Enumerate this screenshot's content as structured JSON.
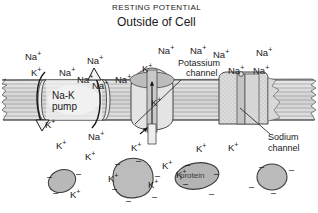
{
  "figure": {
    "title_top": "RESTING POTENTIAL",
    "title_sub": "Outside of Cell",
    "colors": {
      "ink": "#1a1a1a",
      "membrane": "#d9d9d9",
      "protein_fill": "#b5b5b5",
      "paper": "#ffffff"
    }
  },
  "labels": {
    "potassium_channel_line1": "Potassium",
    "potassium_channel_line2": "channel",
    "sodium_channel_line1": "Sodium",
    "sodium_channel_line2": "channel",
    "pump_line1": "Na-K",
    "pump_line2": "pump",
    "protein": "protein"
  },
  "ions": {
    "sodium": "Na",
    "potassium": "K",
    "charge_plus": "+",
    "charge_minus": "–"
  },
  "outside_ions": [
    {
      "label": "Na",
      "x": 25,
      "y": 50
    },
    {
      "label": "K",
      "x": 31,
      "y": 66
    },
    {
      "label": "Na",
      "x": 59,
      "y": 66
    },
    {
      "label": "Na",
      "x": 87,
      "y": 54
    },
    {
      "label": "Na",
      "x": 92,
      "y": 79
    },
    {
      "label": "Na",
      "x": 115,
      "y": 73
    },
    {
      "label": "Na",
      "x": 158,
      "y": 44
    },
    {
      "label": "K",
      "x": 142,
      "y": 62
    },
    {
      "label": "Na",
      "x": 190,
      "y": 44
    },
    {
      "label": "Na",
      "x": 213,
      "y": 48
    },
    {
      "label": "Na",
      "x": 256,
      "y": 46
    },
    {
      "label": "Na",
      "x": 228,
      "y": 64
    },
    {
      "label": "Na",
      "x": 253,
      "y": 64
    }
  ],
  "inside_ions": [
    {
      "label": "K",
      "x": 56,
      "y": 139
    },
    {
      "label": "Na",
      "x": 88,
      "y": 130
    },
    {
      "label": "K",
      "x": 85,
      "y": 150
    },
    {
      "label": "K",
      "x": 131,
      "y": 141
    },
    {
      "label": "K",
      "x": 162,
      "y": 159
    },
    {
      "label": "K",
      "x": 196,
      "y": 142
    },
    {
      "label": "K",
      "x": 228,
      "y": 141
    },
    {
      "label": "K",
      "x": 70,
      "y": 188
    },
    {
      "label": "K",
      "x": 108,
      "y": 172
    },
    {
      "label": "K",
      "x": 176,
      "y": 168
    },
    {
      "label": "K",
      "x": 148,
      "y": 178
    }
  ],
  "pump_ions": [
    {
      "label": "K",
      "x": 45,
      "y": 118
    },
    {
      "label": "Na",
      "x": 77,
      "y": 73
    }
  ],
  "channel_ions": [
    {
      "label": "K",
      "x": 151,
      "y": 96
    }
  ],
  "negatives": [
    {
      "x": 47,
      "y": 173
    },
    {
      "x": 76,
      "y": 170
    },
    {
      "x": 53,
      "y": 189
    },
    {
      "x": 115,
      "y": 160
    },
    {
      "x": 136,
      "y": 157
    },
    {
      "x": 112,
      "y": 185
    },
    {
      "x": 155,
      "y": 172
    },
    {
      "x": 152,
      "y": 193
    },
    {
      "x": 126,
      "y": 197
    },
    {
      "x": 183,
      "y": 180
    },
    {
      "x": 185,
      "y": 161
    },
    {
      "x": 214,
      "y": 170
    },
    {
      "x": 209,
      "y": 190
    },
    {
      "x": 249,
      "y": 183
    },
    {
      "x": 259,
      "y": 163
    },
    {
      "x": 289,
      "y": 166
    },
    {
      "x": 271,
      "y": 189
    }
  ]
}
